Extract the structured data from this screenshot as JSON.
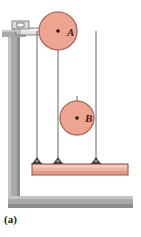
{
  "figure": {
    "caption": "(a)",
    "colors": {
      "pulley_fill": "#eda591",
      "pulley_stroke": "#8c4a38",
      "platform_fill": "#f0b3a2",
      "platform_stroke": "#8c4a38",
      "wall_fill": "#a9a9a9",
      "wall_shade": "#8f8f8f",
      "wall_highlight": "#c9c9c9",
      "bracket_fill": "#d8d8d8",
      "bracket_stroke": "#6b6b6b",
      "cord_color": "#555555",
      "anchor_color": "#3a3a3a",
      "label_color": "#3a2018",
      "background": "#ffffff"
    },
    "pulleys": [
      {
        "name": "pulley-a",
        "label": "A",
        "cx": 58,
        "cy": 31,
        "r": 19,
        "label_x": 67,
        "label_y": 36,
        "mount": "wall-bracket-fixed"
      },
      {
        "name": "pulley-b",
        "label": "B",
        "cx": 77,
        "cy": 118,
        "r": 17,
        "label_x": 86,
        "label_y": 122,
        "mount": "movable-on-cord"
      }
    ],
    "cords": [
      {
        "name": "cord-left-vertical",
        "x": 37,
        "y_top": 31,
        "y_bottom": 163
      },
      {
        "name": "cord-middle-vertical",
        "x": 58,
        "y_top": 31,
        "y_bottom": 163
      },
      {
        "name": "cord-right-vertical",
        "x": 96,
        "y_top": 31,
        "y_bottom": 163
      },
      {
        "name": "cord-pulley-b-hanger",
        "x": 77,
        "y_top": 96,
        "y_bottom": 118
      }
    ],
    "anchors": [
      {
        "name": "anchor-left",
        "x": 37,
        "y": 163
      },
      {
        "name": "anchor-middle",
        "x": 58,
        "y": 163
      },
      {
        "name": "anchor-right",
        "x": 96,
        "y": 163
      }
    ],
    "platform": {
      "name": "anchor-platform",
      "x": 32,
      "y": 163,
      "width": 96,
      "height": 11
    },
    "wall": {
      "name": "wall-and-floor",
      "vertical": {
        "x": 8,
        "y": 30,
        "width": 12,
        "height": 178
      },
      "horizontal": {
        "x": 8,
        "y": 196,
        "width": 125,
        "height": 12
      },
      "cap": {
        "x": 2,
        "y": 30,
        "width": 24,
        "height": 7
      }
    },
    "bracket": {
      "name": "wall-bracket-arm",
      "arm_x": 16,
      "arm_y": 28,
      "arm_width": 42,
      "arm_height": 7,
      "block_x": 12,
      "block_y": 22,
      "block_width": 16,
      "block_height": 7,
      "bolt_x": 17,
      "bolt_y": 23,
      "bolt_width": 7,
      "bolt_height": 4
    }
  }
}
